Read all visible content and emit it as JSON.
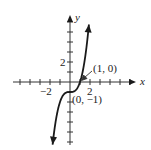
{
  "chart_data": {
    "type": "line",
    "title": "",
    "function": "y = x^3 - 1",
    "xlabel": "x",
    "ylabel": "y",
    "xlim": [
      -5.7,
      6.6
    ],
    "ylim": [
      -6.3,
      6.7
    ],
    "x_tick_labels": [
      {
        "value": -2,
        "label": "−2"
      },
      {
        "value": 2,
        "label": "2"
      }
    ],
    "y_tick_labels": [
      {
        "value": 2,
        "label": "2"
      }
    ],
    "x_ticks": [
      -5,
      -4,
      -3,
      -2,
      -1,
      1,
      2,
      3,
      4,
      5,
      6
    ],
    "y_ticks": [
      -6,
      -5,
      -4,
      -3,
      -2,
      -1,
      1,
      2,
      3,
      4,
      5,
      6
    ],
    "x": [
      -1.74,
      -1.5,
      -1.25,
      -1,
      -0.75,
      -0.5,
      -0.25,
      0,
      0.25,
      0.5,
      0.75,
      1,
      1.25,
      1.5,
      1.75,
      1.89
    ],
    "series": [
      {
        "name": "y = x^3 - 1",
        "values": [
          -6.27,
          -4.38,
          -2.95,
          -2,
          -1.42,
          -1.13,
          -1.02,
          -1,
          -0.98,
          -0.88,
          -0.58,
          0,
          0.95,
          2.38,
          4.36,
          5.75
        ]
      }
    ],
    "annotations": [
      {
        "point": [
          1,
          0
        ],
        "label": "(1, 0)",
        "arrow": true
      },
      {
        "point": [
          0,
          -1
        ],
        "label": "(0, −1)",
        "arrow": false
      }
    ],
    "grid": false,
    "legend": null
  },
  "labels": {
    "x_axis": "x",
    "y_axis": "y",
    "x_neg2": "−2",
    "x_pos2": "2",
    "y_pos2": "2",
    "point_a": "(1, 0)",
    "point_b": "(0, −1)"
  }
}
